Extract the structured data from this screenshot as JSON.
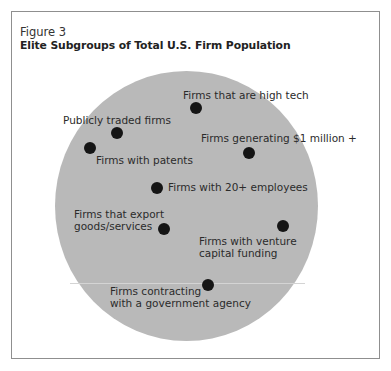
{
  "figure": {
    "label": "Figure 3",
    "title": "Elite Subgroups of Total U.S. Firm Population"
  },
  "diagram": {
    "population_circle": "Total U.S. Firm Population",
    "colors": {
      "circle": "#b9b9b9",
      "dot": "#151515",
      "frame": "#8f8f8f"
    },
    "subgroups": [
      {
        "id": "high-tech",
        "line1": "Firms that are high tech",
        "line2": ""
      },
      {
        "id": "publicly-traded",
        "line1": "Publicly traded firms",
        "line2": ""
      },
      {
        "id": "one-million",
        "line1": "Firms generating $1 million +",
        "line2": ""
      },
      {
        "id": "patents",
        "line1": "Firms with patents",
        "line2": ""
      },
      {
        "id": "twenty-employees",
        "line1": "Firms with 20+ employees",
        "line2": ""
      },
      {
        "id": "export",
        "line1": "Firms that export",
        "line2": "goods/services"
      },
      {
        "id": "venture",
        "line1": "Firms with venture",
        "line2": "capital funding"
      },
      {
        "id": "government",
        "line1": "Firms contracting",
        "line2": "with a government agency"
      }
    ]
  }
}
